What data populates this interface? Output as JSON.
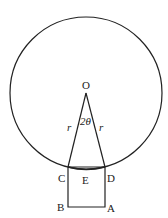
{
  "diagram": {
    "title": "",
    "points": {
      "O": {
        "label": "O",
        "x": 86,
        "y": 93
      },
      "C": {
        "label": "C",
        "x": 68,
        "y": 167
      },
      "D": {
        "label": "D",
        "x": 105,
        "y": 167
      },
      "E": {
        "label": "E"
      },
      "B": {
        "label": "B",
        "x": 68,
        "y": 207
      },
      "A": {
        "label": "A",
        "x": 105,
        "y": 207
      }
    },
    "circle": {
      "cx": 86,
      "cy": 93,
      "r": 76
    },
    "radius_label_left": "r",
    "radius_label_right": "r",
    "angle_label": "2θ",
    "stroke_color": "#222222"
  }
}
